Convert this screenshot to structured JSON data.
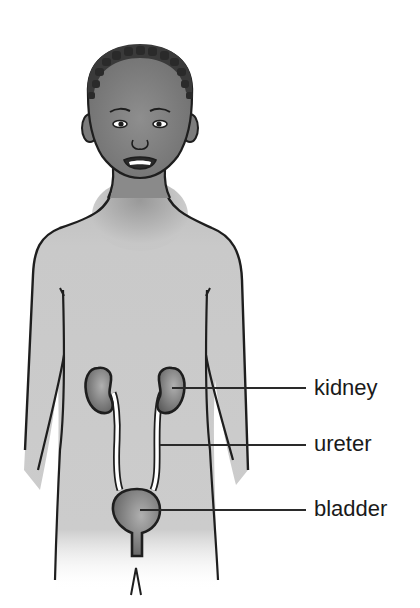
{
  "diagram": {
    "labels": [
      {
        "id": "kidney",
        "text": "kidney"
      },
      {
        "id": "ureter",
        "text": "ureter"
      },
      {
        "id": "bladder",
        "text": "bladder"
      }
    ]
  },
  "colors": {
    "background": "#ffffff",
    "skin": "#c8c8c8",
    "skin_dark": "#8a8a8a",
    "hair": "#2a2a2a",
    "outline": "#1e1e1e",
    "organ": "#7a7a7a",
    "organ_light": "#a8a8a8",
    "leader_line": "#2a2a2a",
    "label_text": "#1a1a1a"
  }
}
